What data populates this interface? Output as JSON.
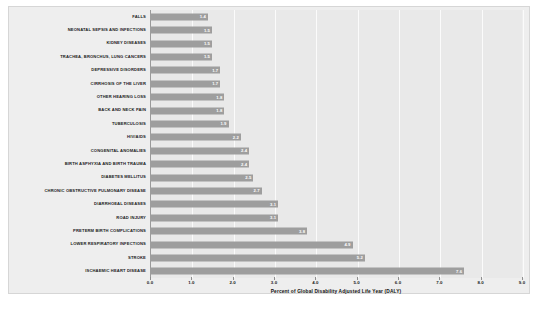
{
  "chart_data": {
    "type": "bar",
    "orientation": "horizontal",
    "title": "",
    "subtitle": "",
    "xlabel": "Percent of Global Disability Adjusted Life Year (DALY)",
    "ylabel": "",
    "xlim": [
      0.0,
      9.0
    ],
    "xticks": [
      "0.0",
      "1.0",
      "2.0",
      "3.0",
      "4.0",
      "5.0",
      "6.0",
      "7.0",
      "8.0",
      "9.0"
    ],
    "grid": "vertical-only",
    "legend": "none",
    "bar_color": "#9e9e9e",
    "plot_background": "#e9e9e9",
    "figure_background": "#eeeeee",
    "value_label_color": "#ffffff",
    "categories": [
      "FALLS",
      "NEONATAL SEPSIS AND INFECTIONS",
      "KIDNEY DISEASES",
      "TRACHEA, BRONCHUS, LUNG CANCERS",
      "DEPRESSIVE DISORDERS",
      "CIRRHOSIS OF THE LIVER",
      "OTHER HEARING LOSS",
      "BACK AND NECK PAIN",
      "TUBERCULOSIS",
      "HIV/AIDS",
      "CONGENITAL ANOMALIES",
      "BIRTH ASPHYXIA AND BIRTH TRAUMA",
      "DIABETES MELLITUS",
      "CHRONIC OBSTRUCTIVE PULMONARY DISEASE",
      "DIARRHOEAL DISEASES",
      "ROAD INJURY",
      "PRETERM BIRTH COMPLICATIONS",
      "LOWER RESPIRATORY INFECTIONS",
      "STROKE",
      "ISCHAEMIC HEART DISEASE"
    ],
    "values": [
      1.4,
      1.5,
      1.5,
      1.5,
      1.7,
      1.7,
      1.8,
      1.8,
      1.9,
      2.2,
      2.4,
      2.4,
      2.5,
      2.7,
      3.1,
      3.1,
      3.8,
      4.9,
      5.2,
      7.6
    ],
    "value_labels": [
      "1.4",
      "1.5",
      "1.5",
      "1.5",
      "1.7",
      "1.7",
      "1.8",
      "1.8",
      "1.9",
      "2.2",
      "2.4",
      "2.4",
      "2.5",
      "2.7",
      "3.1",
      "3.1",
      "3.8",
      "4.9",
      "5.2",
      "7.6"
    ]
  }
}
